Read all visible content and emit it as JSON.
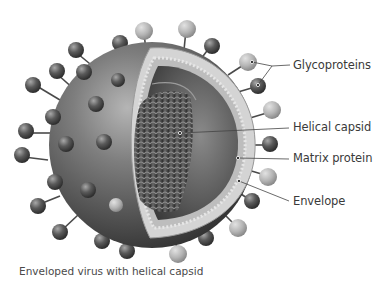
{
  "diagram": {
    "labels": [
      {
        "id": "glycoproteins",
        "text": "Glycoproteins"
      },
      {
        "id": "helical-capsid",
        "text": "Helical capsid"
      },
      {
        "id": "matrix-protein",
        "text": "Matrix protein"
      },
      {
        "id": "envelope",
        "text": "Envelope"
      }
    ],
    "caption": "Enveloped virus with helical capsid"
  },
  "colors": {
    "background": "#ffffff",
    "sphere_dark": "#3c3c3c",
    "sphere_light": "#9a9a9a",
    "interior": "#5a5a5a",
    "membrane": "#d4d4d4",
    "spike_dark": "#555555",
    "spike_light": "#bdbdbd",
    "leader_line": "#444444",
    "text": "#3a3a3a"
  }
}
